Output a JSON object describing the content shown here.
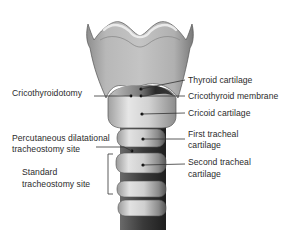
{
  "diagram": {
    "labels_right": {
      "thyroid_cartilage": "Thyroid cartilage",
      "cricothyroid_membrane": "Cricothyroid membrane",
      "cricoid_cartilage": "Cricoid cartilage",
      "first_tracheal_line1": "First tracheal",
      "first_tracheal_line2": "cartilage",
      "second_tracheal_line1": "Second tracheal",
      "second_tracheal_line2": "cartilage"
    },
    "labels_left": {
      "cricothyroidotomy": "Cricothyroidotomy",
      "percutaneous_line1": "Percutaneous dilatational",
      "percutaneous_line2": "tracheostomy site",
      "standard_line1": "Standard",
      "standard_line2": "tracheostomy site"
    },
    "colors": {
      "background": "#ffffff",
      "cartilage_light": "#d9d9d9",
      "cartilage_mid": "#a9a9a9",
      "cartilage_dark": "#5a5a5a",
      "membrane_dark": "#2e2e2e",
      "leader_line": "#333333",
      "text": "#2b2b2b"
    }
  }
}
